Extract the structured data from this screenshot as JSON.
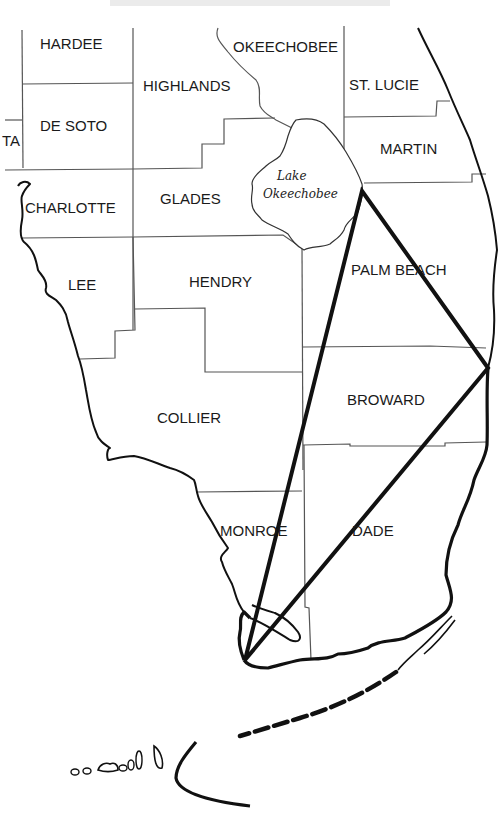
{
  "map": {
    "title_fragment": "",
    "lake": {
      "line1": "Lake",
      "line2": "Okeechobee"
    },
    "counties": [
      {
        "name": "HARDEE",
        "x": 40,
        "y": 49
      },
      {
        "name": "OKEECHOBEE",
        "x": 233,
        "y": 52
      },
      {
        "name": "HIGHLANDS",
        "x": 143,
        "y": 91
      },
      {
        "name": "ST. LUCIE",
        "x": 349,
        "y": 90
      },
      {
        "name": "TA",
        "x": 2,
        "y": 146
      },
      {
        "name": "DE SOTO",
        "x": 40,
        "y": 131
      },
      {
        "name": "MARTIN",
        "x": 380,
        "y": 154
      },
      {
        "name": "CHARLOTTE",
        "x": 25,
        "y": 213
      },
      {
        "name": "GLADES",
        "x": 160,
        "y": 204
      },
      {
        "name": "LEE",
        "x": 68,
        "y": 290
      },
      {
        "name": "HENDRY",
        "x": 189,
        "y": 287
      },
      {
        "name": "PALM BEACH",
        "x": 351,
        "y": 275
      },
      {
        "name": "BROWARD",
        "x": 347,
        "y": 405
      },
      {
        "name": "COLLIER",
        "x": 157,
        "y": 423
      },
      {
        "name": "MONROE",
        "x": 220,
        "y": 536
      },
      {
        "name": "DADE",
        "x": 352,
        "y": 536
      }
    ],
    "triangle": {
      "points": [
        [
          362,
          191
        ],
        [
          488,
          368
        ],
        [
          245,
          660
        ]
      ],
      "color": "#111111"
    }
  }
}
